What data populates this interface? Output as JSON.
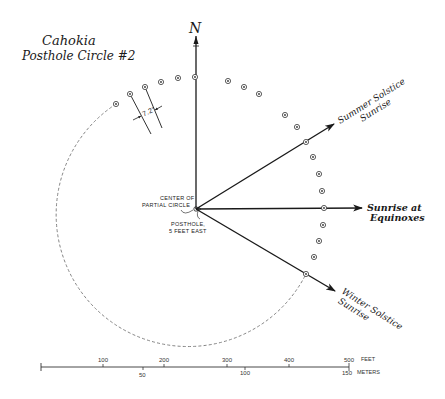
{
  "title": {
    "line1": "Cahokia",
    "line2": "Posthole Circle #2"
  },
  "north": {
    "label": "N",
    "icon": "north-arrow-icon"
  },
  "angle_label": "7.2°",
  "center_labels": {
    "center": [
      "CENTER OF",
      "PARTIAL CIRCLE"
    ],
    "posthole": [
      "POSTHOLE,",
      "5 FEET EAST"
    ]
  },
  "arrows": {
    "summer": [
      "Summer Solstice",
      "Sunrise"
    ],
    "equinox": [
      "Sunrise at",
      "Equinoxes"
    ],
    "winter": [
      "Winter Solstice",
      "Sunrise"
    ]
  },
  "scale_bar": {
    "feet_ticks": [
      "100",
      "200",
      "300",
      "400",
      "500"
    ],
    "feet_unit": "FEET",
    "meter_ticks": [
      "50",
      "100",
      "150"
    ],
    "meter_unit": "METERS"
  },
  "colors": {
    "ink": "#1a1a1a",
    "dashed": "#777777",
    "background": "#ffffff"
  },
  "postholes": [
    [
      116,
      104
    ],
    [
      130,
      94
    ],
    [
      145,
      87
    ],
    [
      161,
      82
    ],
    [
      178,
      78
    ],
    [
      195,
      77
    ],
    [
      228,
      81
    ],
    [
      244,
      87
    ],
    [
      259,
      94
    ],
    [
      285,
      115
    ],
    [
      297,
      127
    ],
    [
      306,
      142
    ],
    [
      313,
      157
    ],
    [
      319,
      174
    ],
    [
      322,
      191
    ],
    [
      324,
      208
    ],
    [
      323,
      225
    ],
    [
      319,
      241
    ],
    [
      314,
      257
    ],
    [
      306,
      274
    ]
  ]
}
